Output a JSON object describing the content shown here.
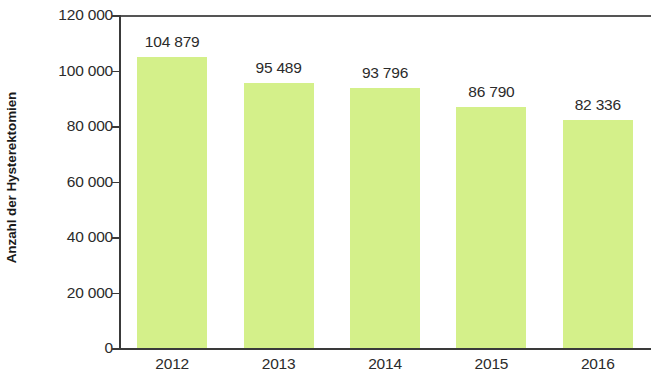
{
  "chart_data": {
    "type": "bar",
    "title": "",
    "subtitle": "",
    "xlabel": "",
    "ylabel": "Anzahl der Hysterektomien",
    "categories": [
      "2012",
      "2013",
      "2014",
      "2015",
      "2016"
    ],
    "values": [
      104879,
      95489,
      93796,
      86790,
      82336
    ],
    "value_labels": [
      "104 879",
      "95 489",
      "93 796",
      "86 790",
      "82 336"
    ],
    "ylim": [
      0,
      120000
    ],
    "y_ticks": [
      0,
      20000,
      40000,
      60000,
      80000,
      100000,
      120000
    ],
    "y_tick_labels": [
      "0",
      "20 000",
      "40 000",
      "60 000",
      "80 000",
      "100 000",
      "120 000"
    ],
    "grid": false,
    "legend": false,
    "legend_position": "none",
    "bar_color": "#d4f08a",
    "axis_color": "#3a3a3a",
    "text_color": "#2b2b2b",
    "background_color": "#ffffff"
  }
}
